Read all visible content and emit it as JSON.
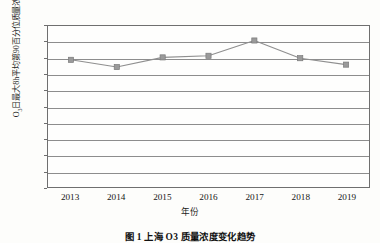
{
  "chart_data": {
    "type": "line",
    "title": "",
    "categories": [
      "2013",
      "2014",
      "2015",
      "2016",
      "2017",
      "2018",
      "2019"
    ],
    "values": [
      158,
      149,
      161,
      163,
      182,
      160,
      152
    ],
    "series": [
      {
        "name": "O3日最大8h平均第90百分位质量浓度值",
        "values": [
          158,
          149,
          161,
          163,
          182,
          160,
          152
        ]
      }
    ],
    "xlabel": "年份",
    "ylabel": "O3日最大8h平均第90百分位质量浓度值/（μg/m3）",
    "ylabel_prefix": "O",
    "ylabel_sub": "3",
    "ylabel_mid": "日最大8h平均第90百分位质量浓度值/（μg/m",
    "ylabel_sup": "3",
    "ylabel_suffix": "）",
    "ylim": [
      0,
      200
    ],
    "ytick_step": 20,
    "yticks": [
      "200",
      "180",
      "160",
      "140",
      "120",
      "100",
      "80",
      "60",
      "40",
      "20",
      "0"
    ],
    "grid": true,
    "grid_axis": "y",
    "legend": "none",
    "marker": "square",
    "line_color": "#8f8f8f",
    "marker_color": "#9a9a9a",
    "marker_edge_color": "#7a7a7a",
    "grid_color": "#8d8d8d",
    "axis_color": "#6f6f6f"
  },
  "caption": {
    "text": "图 1  上海 O3 质量浓度变化趋势"
  }
}
